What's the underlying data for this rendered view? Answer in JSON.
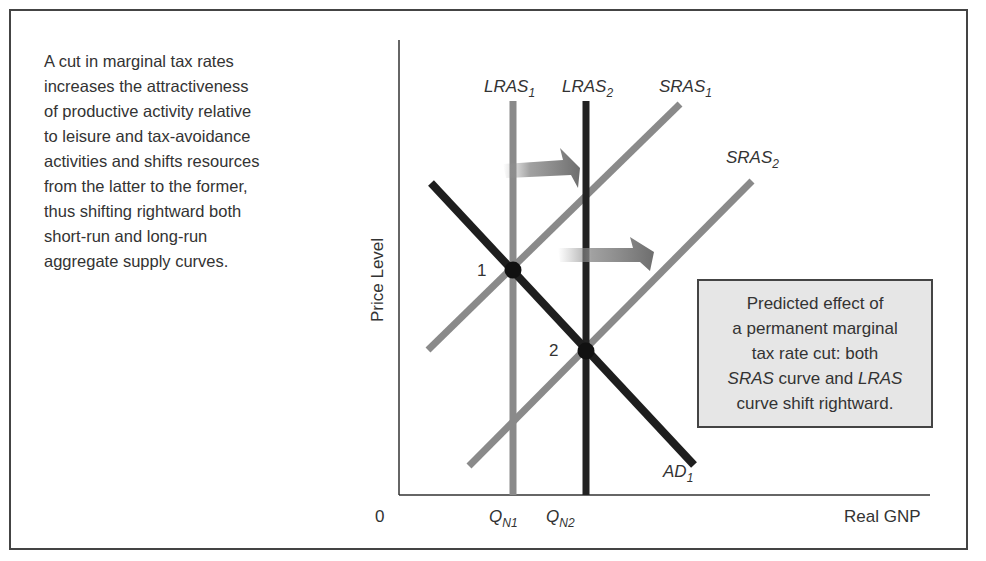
{
  "caption": {
    "lines": [
      "A cut in marginal tax rates",
      "increases the attractiveness",
      "of productive activity relative",
      "to leisure and tax-avoidance",
      "activities and shifts resources",
      "from the latter to the former,",
      "thus shifting rightward both",
      "short-run and long-run",
      "aggregate supply curves."
    ]
  },
  "axes": {
    "ylabel": "Price Level",
    "xlabel": "Real GNP",
    "origin": "0"
  },
  "curves": {
    "lras1": {
      "name": "LRAS",
      "sub": "1"
    },
    "lras2": {
      "name": "LRAS",
      "sub": "2"
    },
    "sras1": {
      "name": "SRAS",
      "sub": "1"
    },
    "sras2": {
      "name": "SRAS",
      "sub": "2"
    },
    "ad1": {
      "name": "AD",
      "sub": "1"
    }
  },
  "ticks": {
    "qn1": {
      "name": "Q",
      "sub": "N1"
    },
    "qn2": {
      "name": "Q",
      "sub": "N2"
    }
  },
  "points": {
    "p1": "1",
    "p2": "2"
  },
  "note": {
    "line1": "Predicted effect of",
    "line2": "a permanent marginal",
    "line3": "tax rate cut: both",
    "line4_a": "SRAS",
    "line4_b": " curve and ",
    "line4_c": "LRAS",
    "line5": "curve shift rightward."
  },
  "colors": {
    "gray_curve": "#8a8a8a",
    "dark_curve": "#1e1e1e",
    "note_bg": "#e6e6e6",
    "frame": "#444444"
  }
}
